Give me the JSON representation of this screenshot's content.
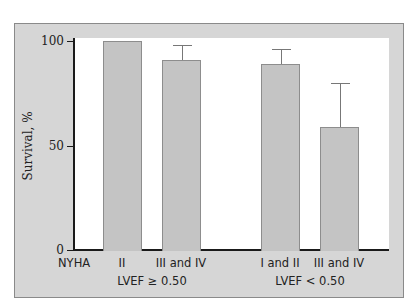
{
  "chart_data": {
    "type": "bar",
    "title": "",
    "xlabel": "NYHA",
    "ylabel": "Survival, %",
    "ylim": [
      0,
      100
    ],
    "yticks": [
      0,
      50,
      100
    ],
    "grid": false,
    "legend": null,
    "categories": [
      "II",
      "III and IV",
      "I and II",
      "III and IV"
    ],
    "groups": [
      {
        "label": "LVEF ≥ 0.50",
        "categories": [
          "II",
          "III and IV"
        ]
      },
      {
        "label": "LVEF < 0.50",
        "categories": [
          "I and II",
          "III and IV"
        ]
      }
    ],
    "values": [
      100,
      91,
      89,
      59
    ],
    "error_upper": [
      null,
      98,
      96,
      80
    ]
  },
  "axis": {
    "y_label": "Survival, %",
    "x_row_label": "NYHA",
    "ticks": [
      "100",
      "50",
      "0"
    ]
  },
  "bars": [
    {
      "label": "II",
      "value": 100,
      "err": null
    },
    {
      "label": "III and IV",
      "value": 91,
      "err": 98
    },
    {
      "label": "I and II",
      "value": 89,
      "err": 96
    },
    {
      "label": "III and IV",
      "value": 59,
      "err": 80
    }
  ],
  "groups": [
    {
      "label": "LVEF ≥ 0.50"
    },
    {
      "label": "LVEF < 0.50"
    }
  ],
  "colors": {
    "frame": "#d6d6d6",
    "bar_fill": "#c4c4c4",
    "bar_edge": "#8d8d8d",
    "axis": "#1a1a1a"
  }
}
